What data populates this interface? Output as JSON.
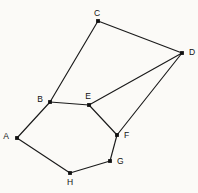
{
  "figure": {
    "background_color": "#fbfaf7",
    "line_color": "#1a1a1a",
    "vertex_color": "#111111",
    "label_color": "#111111",
    "width": 198,
    "height": 193
  },
  "chart_data": {
    "type": "diagram",
    "subtype": "node-link-graph",
    "directed": false,
    "weighted": false,
    "title": "",
    "xlabel": "",
    "ylabel": "",
    "grid": false,
    "legend": null,
    "node_count": 8,
    "edge_count": 10,
    "nodes": [
      {
        "id": "A",
        "label": "A",
        "x": 17,
        "y": 138,
        "label_x": 9,
        "label_y": 137,
        "label_anchor": "end",
        "label_baseline": "middle"
      },
      {
        "id": "B",
        "label": "B",
        "x": 50,
        "y": 102,
        "label_x": 43,
        "label_y": 100,
        "label_anchor": "end",
        "label_baseline": "middle"
      },
      {
        "id": "C",
        "label": "C",
        "x": 98,
        "y": 21,
        "label_x": 97,
        "label_y": 14,
        "label_anchor": "middle",
        "label_baseline": "middle"
      },
      {
        "id": "D",
        "label": "D",
        "x": 182,
        "y": 53,
        "label_x": 189,
        "label_y": 53,
        "label_anchor": "start",
        "label_baseline": "middle"
      },
      {
        "id": "E",
        "label": "E",
        "x": 89,
        "y": 105,
        "label_x": 88,
        "label_y": 97,
        "label_anchor": "middle",
        "label_baseline": "middle"
      },
      {
        "id": "F",
        "label": "F",
        "x": 117,
        "y": 135,
        "label_x": 124,
        "label_y": 136,
        "label_anchor": "start",
        "label_baseline": "middle"
      },
      {
        "id": "G",
        "label": "G",
        "x": 110,
        "y": 161,
        "label_x": 117,
        "label_y": 162,
        "label_anchor": "start",
        "label_baseline": "middle"
      },
      {
        "id": "H",
        "label": "H",
        "x": 70,
        "y": 173,
        "label_x": 70,
        "label_y": 183,
        "label_anchor": "middle",
        "label_baseline": "middle"
      }
    ],
    "edges": [
      {
        "source": "A",
        "target": "B",
        "x1": 17,
        "y1": 138,
        "x2": 50,
        "y2": 102
      },
      {
        "source": "B",
        "target": "C",
        "x1": 50,
        "y1": 102,
        "x2": 98,
        "y2": 21
      },
      {
        "source": "C",
        "target": "D",
        "x1": 98,
        "y1": 21,
        "x2": 182,
        "y2": 53
      },
      {
        "source": "D",
        "target": "E",
        "x1": 182,
        "y1": 53,
        "x2": 89,
        "y2": 105
      },
      {
        "source": "D",
        "target": "F",
        "x1": 182,
        "y1": 53,
        "x2": 117,
        "y2": 135
      },
      {
        "source": "B",
        "target": "E",
        "x1": 50,
        "y1": 102,
        "x2": 89,
        "y2": 105
      },
      {
        "source": "E",
        "target": "F",
        "x1": 89,
        "y1": 105,
        "x2": 117,
        "y2": 135
      },
      {
        "source": "F",
        "target": "G",
        "x1": 117,
        "y1": 135,
        "x2": 110,
        "y2": 161
      },
      {
        "source": "G",
        "target": "H",
        "x1": 110,
        "y1": 161,
        "x2": 70,
        "y2": 173
      },
      {
        "source": "H",
        "target": "A",
        "x1": 70,
        "y1": 173,
        "x2": 17,
        "y2": 138
      }
    ],
    "adjacency": {
      "A": [
        "B",
        "H"
      ],
      "B": [
        "A",
        "C",
        "E"
      ],
      "C": [
        "B",
        "D"
      ],
      "D": [
        "C",
        "E",
        "F"
      ],
      "E": [
        "B",
        "D",
        "F"
      ],
      "F": [
        "D",
        "E",
        "G"
      ],
      "G": [
        "F",
        "H"
      ],
      "H": [
        "G",
        "A"
      ]
    }
  }
}
